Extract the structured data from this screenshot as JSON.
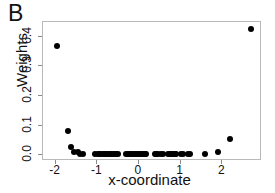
{
  "panel": {
    "label": "B"
  },
  "axes": {
    "xlabel": "x-coordinate",
    "ylabel": "Weights",
    "xticks": [
      "-2",
      "-1",
      "0",
      "1",
      "2"
    ],
    "yticks": [
      "0.0",
      "0.1",
      "0.2",
      "0.3",
      "0.4"
    ]
  },
  "colors": {
    "point": "#000000",
    "frame": "#b9b9b9",
    "text": "#111111"
  },
  "chart_data": {
    "type": "scatter",
    "title": "B",
    "xlabel": "x-coordinate",
    "ylabel": "Weights",
    "xlim": [
      -2.3,
      2.95
    ],
    "ylim": [
      -0.02,
      0.45
    ],
    "grid": false,
    "legend": null,
    "marker": "filled-circle",
    "series": [
      {
        "name": "Weights",
        "x": [
          -1.97,
          -1.7,
          -1.63,
          -1.55,
          -1.47,
          -1.41,
          -1.35,
          -1.05,
          -0.99,
          -0.95,
          -0.91,
          -0.86,
          -0.82,
          -0.78,
          -0.74,
          -0.7,
          -0.66,
          -0.62,
          -0.58,
          -0.54,
          -0.5,
          -0.3,
          -0.26,
          -0.22,
          -0.18,
          -0.14,
          -0.1,
          -0.06,
          -0.02,
          0.02,
          0.06,
          0.1,
          0.14,
          0.18,
          0.38,
          0.42,
          0.46,
          0.54,
          0.58,
          0.7,
          0.74,
          0.78,
          0.82,
          0.86,
          0.9,
          1.02,
          1.06,
          1.18,
          1.22,
          1.58,
          1.9,
          2.18,
          2.68
        ],
        "y": [
          0.368,
          0.08,
          0.028,
          0.012,
          0.01,
          0.004,
          0.003,
          0.002,
          0.002,
          0.002,
          0.002,
          0.002,
          0.002,
          0.002,
          0.002,
          0.002,
          0.002,
          0.002,
          0.002,
          0.002,
          0.002,
          0.002,
          0.002,
          0.002,
          0.002,
          0.002,
          0.002,
          0.002,
          0.002,
          0.002,
          0.002,
          0.002,
          0.002,
          0.002,
          0.002,
          0.002,
          0.002,
          0.002,
          0.002,
          0.002,
          0.002,
          0.002,
          0.002,
          0.002,
          0.002,
          0.002,
          0.002,
          0.002,
          0.002,
          0.004,
          0.012,
          0.053,
          0.425
        ]
      }
    ]
  }
}
